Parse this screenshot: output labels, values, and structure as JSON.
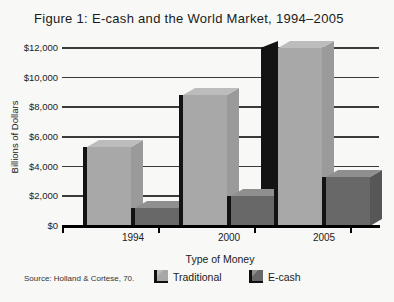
{
  "title": "Figure 1: E-cash and the World Market, 1994–2005",
  "source": "Source: Holland & Cortese, 70.",
  "y_axis": {
    "label": "Billions of Dollars",
    "tick_labels": [
      "$12,000",
      "$10,000",
      "$8,000",
      "$6,000",
      "$4,000",
      "$2,000",
      "$0"
    ],
    "tick_values": [
      12000,
      10000,
      8000,
      6000,
      4000,
      2000,
      0
    ]
  },
  "x_axis": {
    "label": "Type of Money",
    "categories": [
      "1994",
      "2000",
      "2005"
    ]
  },
  "legend": [
    {
      "label": "Traditional"
    },
    {
      "label": "E-cash"
    }
  ],
  "colors": {
    "background": "#f8f8f6",
    "grid": "#3a3a3a",
    "axis": "#000000",
    "shadow": "#131313",
    "text": "#1c1c1c",
    "series": [
      {
        "name": "Traditional",
        "front": "#a8a8a8",
        "top": "#bcbcbc",
        "side": "#9a9a9a"
      },
      {
        "name": "E-cash",
        "front": "#686868",
        "top": "#8f8f8f",
        "side": "#575757"
      }
    ]
  },
  "chart_data": {
    "type": "bar",
    "style": "3d-column",
    "title": "Figure 1: E-cash and the World Market, 1994–2005",
    "categories": [
      "1994",
      "2000",
      "2005"
    ],
    "series": [
      {
        "name": "Traditional",
        "values": [
          5300,
          8800,
          12000
        ]
      },
      {
        "name": "E-cash",
        "values": [
          1200,
          2000,
          3300
        ]
      }
    ],
    "xlabel": "Type of Money",
    "ylabel": "Billions of Dollars",
    "ylim": [
      0,
      12000
    ],
    "ytick_interval": 2000,
    "grid": true,
    "legend_position": "bottom"
  }
}
